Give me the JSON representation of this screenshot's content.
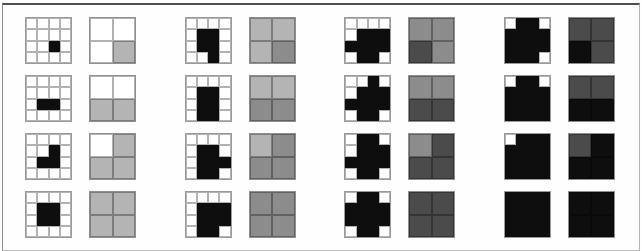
{
  "figure": {
    "kind": "resolution-vs-grayscale-diagram",
    "palette": {
      "shade_levels": [
        "#ffffff",
        "#b4b4b4",
        "#8c8c8c",
        "#4b4b4b",
        "#0e0e0e"
      ],
      "shape_black": "#0e0e0e",
      "grid_line": "#9a9a9a",
      "frame_rule": "#4f4f4f",
      "background": "#fefefe"
    },
    "groups": [
      {
        "rows": [
          {
            "binary_grid": {
              "size": 4,
              "black_cells": [
                [
                  2,
                  2
                ]
              ]
            },
            "gray_grid": {
              "size": 2,
              "levels": [
                [
                  0,
                  0
                ],
                [
                  0,
                  1
                ]
              ]
            }
          },
          {
            "binary_grid": {
              "size": 4,
              "black_cells": [
                [
                  2,
                  1
                ],
                [
                  2,
                  2
                ]
              ]
            },
            "gray_grid": {
              "size": 2,
              "levels": [
                [
                  0,
                  0
                ],
                [
                  1,
                  1
                ]
              ]
            }
          },
          {
            "binary_grid": {
              "size": 4,
              "black_cells": [
                [
                  1,
                  2
                ],
                [
                  2,
                  1
                ],
                [
                  2,
                  2
                ]
              ]
            },
            "gray_grid": {
              "size": 2,
              "levels": [
                [
                  0,
                  1
                ],
                [
                  1,
                  1
                ]
              ]
            }
          },
          {
            "binary_grid": {
              "size": 4,
              "black_cells": [
                [
                  1,
                  1
                ],
                [
                  1,
                  2
                ],
                [
                  2,
                  1
                ],
                [
                  2,
                  2
                ]
              ]
            },
            "gray_grid": {
              "size": 2,
              "levels": [
                [
                  1,
                  1
                ],
                [
                  1,
                  1
                ]
              ]
            }
          }
        ]
      },
      {
        "rows": [
          {
            "binary_grid": {
              "size": 4,
              "black_cells": [
                [
                  1,
                  1
                ],
                [
                  1,
                  2
                ],
                [
                  2,
                  1
                ],
                [
                  2,
                  2
                ],
                [
                  3,
                  2
                ]
              ]
            },
            "gray_grid": {
              "size": 2,
              "levels": [
                [
                  1,
                  1
                ],
                [
                  1,
                  2
                ]
              ]
            }
          },
          {
            "binary_grid": {
              "size": 4,
              "black_cells": [
                [
                  1,
                  1
                ],
                [
                  1,
                  2
                ],
                [
                  2,
                  1
                ],
                [
                  2,
                  2
                ],
                [
                  3,
                  1
                ],
                [
                  3,
                  2
                ]
              ]
            },
            "gray_grid": {
              "size": 2,
              "levels": [
                [
                  1,
                  1
                ],
                [
                  2,
                  2
                ]
              ]
            }
          },
          {
            "binary_grid": {
              "size": 4,
              "black_cells": [
                [
                  1,
                  1
                ],
                [
                  1,
                  2
                ],
                [
                  2,
                  1
                ],
                [
                  2,
                  2
                ],
                [
                  2,
                  3
                ],
                [
                  3,
                  1
                ],
                [
                  3,
                  2
                ]
              ]
            },
            "gray_grid": {
              "size": 2,
              "levels": [
                [
                  1,
                  2
                ],
                [
                  2,
                  2
                ]
              ]
            }
          },
          {
            "binary_grid": {
              "size": 4,
              "black_cells": [
                [
                  1,
                  1
                ],
                [
                  1,
                  2
                ],
                [
                  1,
                  3
                ],
                [
                  2,
                  1
                ],
                [
                  2,
                  2
                ],
                [
                  2,
                  3
                ],
                [
                  3,
                  1
                ],
                [
                  3,
                  2
                ]
              ]
            },
            "gray_grid": {
              "size": 2,
              "levels": [
                [
                  2,
                  2
                ],
                [
                  2,
                  2
                ]
              ]
            }
          }
        ]
      },
      {
        "rows": [
          {
            "binary_grid": {
              "size": 4,
              "black_cells": [
                [
                  1,
                  1
                ],
                [
                  1,
                  2
                ],
                [
                  1,
                  3
                ],
                [
                  2,
                  0
                ],
                [
                  2,
                  1
                ],
                [
                  2,
                  2
                ],
                [
                  2,
                  3
                ],
                [
                  3,
                  1
                ],
                [
                  3,
                  2
                ]
              ]
            },
            "gray_grid": {
              "size": 2,
              "levels": [
                [
                  2,
                  2
                ],
                [
                  3,
                  2
                ]
              ]
            }
          },
          {
            "binary_grid": {
              "size": 4,
              "black_cells": [
                [
                  0,
                  2
                ],
                [
                  1,
                  1
                ],
                [
                  1,
                  2
                ],
                [
                  1,
                  3
                ],
                [
                  2,
                  0
                ],
                [
                  2,
                  1
                ],
                [
                  2,
                  2
                ],
                [
                  2,
                  3
                ],
                [
                  3,
                  1
                ],
                [
                  3,
                  2
                ]
              ]
            },
            "gray_grid": {
              "size": 2,
              "levels": [
                [
                  2,
                  2
                ],
                [
                  3,
                  3
                ]
              ]
            }
          },
          {
            "binary_grid": {
              "size": 4,
              "black_cells": [
                [
                  0,
                  1
                ],
                [
                  0,
                  2
                ],
                [
                  1,
                  1
                ],
                [
                  1,
                  2
                ],
                [
                  1,
                  3
                ],
                [
                  2,
                  0
                ],
                [
                  2,
                  1
                ],
                [
                  2,
                  2
                ],
                [
                  2,
                  3
                ],
                [
                  3,
                  1
                ],
                [
                  3,
                  2
                ]
              ]
            },
            "gray_grid": {
              "size": 2,
              "levels": [
                [
                  2,
                  3
                ],
                [
                  3,
                  3
                ]
              ]
            }
          },
          {
            "binary_grid": {
              "size": 4,
              "black_cells": [
                [
                  0,
                  1
                ],
                [
                  0,
                  2
                ],
                [
                  1,
                  0
                ],
                [
                  1,
                  1
                ],
                [
                  1,
                  2
                ],
                [
                  1,
                  3
                ],
                [
                  2,
                  0
                ],
                [
                  2,
                  1
                ],
                [
                  2,
                  2
                ],
                [
                  2,
                  3
                ],
                [
                  3,
                  1
                ],
                [
                  3,
                  2
                ]
              ]
            },
            "gray_grid": {
              "size": 2,
              "levels": [
                [
                  3,
                  3
                ],
                [
                  3,
                  3
                ]
              ]
            }
          }
        ]
      },
      {
        "rows": [
          {
            "binary_grid": {
              "size": 4,
              "black_cells": [
                [
                  0,
                  1
                ],
                [
                  0,
                  2
                ],
                [
                  1,
                  0
                ],
                [
                  1,
                  1
                ],
                [
                  1,
                  2
                ],
                [
                  1,
                  3
                ],
                [
                  2,
                  0
                ],
                [
                  2,
                  1
                ],
                [
                  2,
                  2
                ],
                [
                  2,
                  3
                ],
                [
                  3,
                  0
                ],
                [
                  3,
                  1
                ],
                [
                  3,
                  2
                ]
              ]
            },
            "gray_grid": {
              "size": 2,
              "levels": [
                [
                  3,
                  3
                ],
                [
                  4,
                  3
                ]
              ]
            }
          },
          {
            "binary_grid": {
              "size": 4,
              "black_cells": [
                [
                  0,
                  1
                ],
                [
                  0,
                  2
                ],
                [
                  1,
                  0
                ],
                [
                  1,
                  1
                ],
                [
                  1,
                  2
                ],
                [
                  1,
                  3
                ],
                [
                  2,
                  0
                ],
                [
                  2,
                  1
                ],
                [
                  2,
                  2
                ],
                [
                  2,
                  3
                ],
                [
                  3,
                  0
                ],
                [
                  3,
                  1
                ],
                [
                  3,
                  2
                ],
                [
                  3,
                  3
                ]
              ]
            },
            "gray_grid": {
              "size": 2,
              "levels": [
                [
                  3,
                  3
                ],
                [
                  4,
                  4
                ]
              ]
            }
          },
          {
            "binary_grid": {
              "size": 4,
              "black_cells": [
                [
                  0,
                  1
                ],
                [
                  0,
                  2
                ],
                [
                  0,
                  3
                ],
                [
                  1,
                  0
                ],
                [
                  1,
                  1
                ],
                [
                  1,
                  2
                ],
                [
                  1,
                  3
                ],
                [
                  2,
                  0
                ],
                [
                  2,
                  1
                ],
                [
                  2,
                  2
                ],
                [
                  2,
                  3
                ],
                [
                  3,
                  0
                ],
                [
                  3,
                  1
                ],
                [
                  3,
                  2
                ],
                [
                  3,
                  3
                ]
              ]
            },
            "gray_grid": {
              "size": 2,
              "levels": [
                [
                  3,
                  4
                ],
                [
                  4,
                  4
                ]
              ]
            }
          },
          {
            "binary_grid": {
              "size": 4,
              "black_cells": [
                [
                  0,
                  0
                ],
                [
                  0,
                  1
                ],
                [
                  0,
                  2
                ],
                [
                  0,
                  3
                ],
                [
                  1,
                  0
                ],
                [
                  1,
                  1
                ],
                [
                  1,
                  2
                ],
                [
                  1,
                  3
                ],
                [
                  2,
                  0
                ],
                [
                  2,
                  1
                ],
                [
                  2,
                  2
                ],
                [
                  2,
                  3
                ],
                [
                  3,
                  0
                ],
                [
                  3,
                  1
                ],
                [
                  3,
                  2
                ],
                [
                  3,
                  3
                ]
              ]
            },
            "gray_grid": {
              "size": 2,
              "levels": [
                [
                  4,
                  4
                ],
                [
                  4,
                  4
                ]
              ]
            }
          }
        ]
      }
    ]
  }
}
